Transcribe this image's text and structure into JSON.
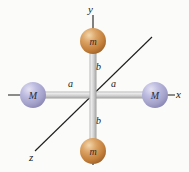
{
  "figure": {
    "background_color": "#fbfbf9"
  },
  "axes": [
    {
      "name": "y-axis",
      "label": "y",
      "direction": "up",
      "label_x": 88,
      "label_y": 4
    },
    {
      "name": "x-axis",
      "label": "x",
      "direction": "right",
      "label_x": 176,
      "label_y": 89
    },
    {
      "name": "z-axis",
      "label": "z",
      "direction": "lower-left-diagonal",
      "label_x": 29,
      "label_y": 152
    }
  ],
  "spheres": [
    {
      "id": "mass-m-top",
      "label": "m",
      "color": "#c8833e",
      "highlight": "#f0cda0",
      "cx": 93,
      "cy": 41,
      "r": 13
    },
    {
      "id": "mass-m-bottom",
      "label": "m",
      "color": "#c8833e",
      "highlight": "#f0cda0",
      "cx": 93,
      "cy": 151,
      "r": 13
    },
    {
      "id": "mass-M-left",
      "label": "M",
      "color": "#a8a7cf",
      "highlight": "#dcdcf0",
      "cx": 33,
      "cy": 95,
      "r": 13
    },
    {
      "id": "mass-M-right",
      "label": "M",
      "color": "#a8a7cf",
      "highlight": "#dcdcf0",
      "cx": 155,
      "cy": 95,
      "r": 13
    }
  ],
  "distance_labels": [
    {
      "id": "dist-b-top",
      "label": "b",
      "x": 96,
      "y": 62
    },
    {
      "id": "dist-b-bottom",
      "label": "b",
      "x": 96,
      "y": 116
    },
    {
      "id": "dist-a-left",
      "label": "a",
      "x": 68,
      "y": 79
    },
    {
      "id": "dist-a-right",
      "label": "a",
      "x": 111,
      "y": 79
    }
  ],
  "colors": {
    "rod": "#c9c9c9",
    "rod_highlight": "#eeeeee",
    "rod_shadow": "#9b9b9b",
    "axis_line": "#1d1d1d",
    "text": "#1a1a1a"
  }
}
